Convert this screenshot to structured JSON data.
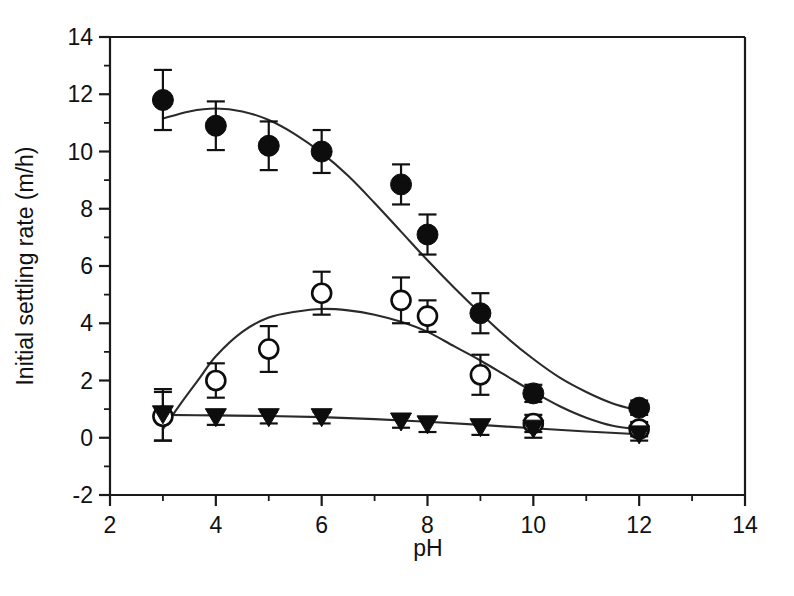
{
  "chart_data": {
    "type": "scatter",
    "title": "",
    "subtitle": "",
    "xlabel": "pH",
    "ylabel": "Initial settling rate (m/h)",
    "xlim": [
      2,
      14
    ],
    "ylim": [
      -2,
      14
    ],
    "x_major_ticks": [
      2,
      4,
      6,
      8,
      10,
      12,
      14
    ],
    "x_minor_ticks": [
      3,
      5,
      7,
      9,
      11,
      13
    ],
    "y_major_ticks": [
      -2,
      0,
      2,
      4,
      6,
      8,
      10,
      12,
      14
    ],
    "y_minor_ticks": [
      -1,
      1,
      3,
      5,
      7,
      9,
      11,
      13
    ],
    "x_tick_labels": [
      "2",
      "4",
      "6",
      "8",
      "10",
      "12",
      "14"
    ],
    "y_tick_labels": [
      "-2",
      "0",
      "2",
      "4",
      "6",
      "8",
      "10",
      "12",
      "14"
    ],
    "grid": false,
    "legend": "none",
    "series": [
      {
        "name": "filled-circle-series",
        "marker": "filled-circle",
        "x": [
          3,
          4,
          5,
          6,
          7.5,
          8,
          9,
          10,
          12
        ],
        "values": [
          11.8,
          10.9,
          10.2,
          10.0,
          8.85,
          7.1,
          4.35,
          1.55,
          1.05
        ],
        "yerr": [
          1.05,
          0.85,
          0.85,
          0.75,
          0.7,
          0.7,
          0.7,
          0.3,
          0.25
        ],
        "fit_points": [
          [
            3,
            11.15
          ],
          [
            3.5,
            11.4
          ],
          [
            4,
            11.5
          ],
          [
            4.5,
            11.4
          ],
          [
            5,
            11.1
          ],
          [
            5.5,
            10.6
          ],
          [
            6,
            9.95
          ],
          [
            6.5,
            9.15
          ],
          [
            7,
            8.2
          ],
          [
            7.5,
            7.2
          ],
          [
            8,
            6.2
          ],
          [
            8.5,
            5.25
          ],
          [
            9,
            4.35
          ],
          [
            9.5,
            3.5
          ],
          [
            10,
            2.75
          ],
          [
            10.5,
            2.1
          ],
          [
            11,
            1.6
          ],
          [
            11.5,
            1.2
          ],
          [
            12,
            0.95
          ]
        ]
      },
      {
        "name": "open-circle-series",
        "marker": "open-circle",
        "x": [
          3,
          4,
          5,
          6,
          7.5,
          8,
          9,
          10,
          12
        ],
        "values": [
          0.75,
          2.0,
          3.1,
          5.05,
          4.8,
          4.25,
          2.2,
          0.5,
          0.3
        ],
        "yerr": [
          0.85,
          0.6,
          0.8,
          0.75,
          0.8,
          0.55,
          0.7,
          0.3,
          0.25
        ],
        "fit_points": [
          [
            3,
            0.3
          ],
          [
            3.3,
            1.1
          ],
          [
            3.7,
            2.1
          ],
          [
            4,
            2.85
          ],
          [
            4.5,
            3.7
          ],
          [
            5,
            4.2
          ],
          [
            5.5,
            4.4
          ],
          [
            6,
            4.5
          ],
          [
            6.5,
            4.45
          ],
          [
            7,
            4.3
          ],
          [
            7.5,
            4.05
          ],
          [
            8,
            3.7
          ],
          [
            8.5,
            3.2
          ],
          [
            9,
            2.7
          ],
          [
            9.5,
            2.15
          ],
          [
            10,
            1.6
          ],
          [
            10.5,
            1.1
          ],
          [
            11,
            0.7
          ],
          [
            11.5,
            0.42
          ],
          [
            12,
            0.3
          ]
        ]
      },
      {
        "name": "filled-triangle-series",
        "marker": "filled-triangle",
        "x": [
          3,
          4,
          5,
          6,
          7.5,
          8,
          9,
          10,
          12
        ],
        "values": [
          0.8,
          0.7,
          0.7,
          0.7,
          0.55,
          0.45,
          0.35,
          0.3,
          0.1
        ],
        "yerr": [
          0.9,
          0.25,
          0.2,
          0.2,
          0.2,
          0.25,
          0.25,
          0.3,
          0.2
        ],
        "fit_points": [
          [
            3,
            0.8
          ],
          [
            4,
            0.78
          ],
          [
            5,
            0.76
          ],
          [
            6,
            0.72
          ],
          [
            7,
            0.65
          ],
          [
            8,
            0.56
          ],
          [
            9,
            0.45
          ],
          [
            10,
            0.33
          ],
          [
            11,
            0.22
          ],
          [
            12,
            0.12
          ]
        ]
      }
    ],
    "colors": {
      "axis": "#1a1a1a",
      "line": "#2a2a2a",
      "marker_fill": "#0d0d0d",
      "marker_open_fill": "#ffffff",
      "background": "#ffffff",
      "text": "#111111"
    }
  }
}
